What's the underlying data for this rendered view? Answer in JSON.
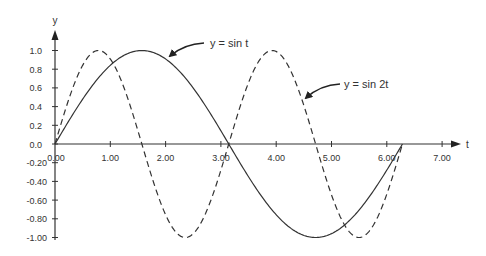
{
  "chart_data": {
    "type": "line",
    "title": "",
    "xlabel": "t",
    "ylabel": "y",
    "xlim": [
      0,
      7.3
    ],
    "ylim": [
      -1.0,
      1.1
    ],
    "grid": false,
    "x_ticks": [
      "0.00",
      "1.00",
      "2.00",
      "3.00",
      "4.00",
      "5.00",
      "6.00",
      "7.00"
    ],
    "x_tick_values": [
      0,
      1,
      2,
      3,
      4,
      5,
      6,
      7
    ],
    "y_ticks": [
      "1.0",
      "0.8",
      "0.6",
      "0.4",
      "0.2",
      "0.0",
      "-0.20",
      "-0.40",
      "-0.60",
      "-0.80",
      "-1.00"
    ],
    "y_tick_values": [
      1.0,
      0.8,
      0.6,
      0.4,
      0.2,
      0.0,
      -0.2,
      -0.4,
      -0.6,
      -0.8,
      -1.0
    ],
    "t_range": [
      0,
      6.2832
    ],
    "series": [
      {
        "name": "y = sin t",
        "style": "solid",
        "color": "#333333",
        "x": [
          0,
          0.79,
          1.57,
          2.36,
          3.14,
          3.93,
          4.71,
          5.5,
          6.28
        ],
        "values": [
          0,
          0.71,
          1.0,
          0.71,
          0,
          -0.71,
          -1.0,
          -0.71,
          0
        ]
      },
      {
        "name": "y = sin 2t",
        "style": "dashed",
        "color": "#333333",
        "x": [
          0,
          0.39,
          0.79,
          1.18,
          1.57,
          1.96,
          2.36,
          2.75,
          3.14,
          3.53,
          3.93,
          4.32,
          4.71,
          5.11,
          5.5,
          5.89,
          6.28
        ],
        "values": [
          0,
          0.71,
          1.0,
          0.71,
          0,
          -0.71,
          -1.0,
          -0.71,
          0,
          0.71,
          1.0,
          0.71,
          0,
          -0.71,
          -1.0,
          -0.71,
          0
        ]
      }
    ],
    "annotations": [
      {
        "text": "y = sin t",
        "target": "y = sin t"
      },
      {
        "text": "y = sin 2t",
        "target": "y = sin 2t"
      }
    ],
    "legend": null
  },
  "labels": {
    "x_axis": "t",
    "y_axis": "y",
    "annot_sin_t": "y = sin t",
    "annot_sin_2t": "y = sin 2t"
  }
}
